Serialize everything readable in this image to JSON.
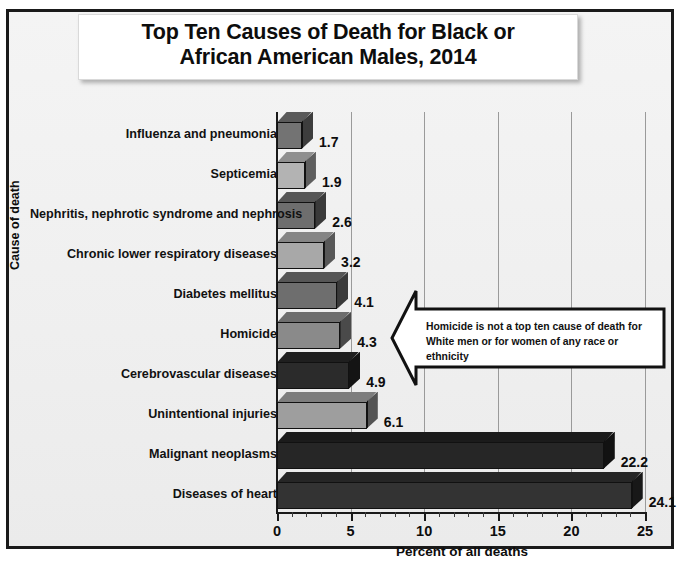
{
  "title": {
    "line1": "Top Ten Causes of Death for Black or",
    "line2": "African American Males, 2014"
  },
  "callout": {
    "text": "Homicide is not a top ten cause of death for White men or for women of any race or ethnicity",
    "shape": "left-arrow-callout"
  },
  "chart_data": {
    "type": "bar",
    "orientation": "horizontal",
    "title": "Top Ten Causes of Death for Black or African American Males, 2014",
    "xlabel": "Percent of all deaths",
    "ylabel": "Cause of death",
    "xlim": [
      0,
      25
    ],
    "xticks": [
      0,
      5,
      10,
      15,
      20,
      25
    ],
    "xtick_labels": [
      "0",
      "5",
      "10",
      "15",
      "20",
      "25"
    ],
    "minor_tick_step": 1,
    "grid": "vertical",
    "legend": "none",
    "categories": [
      "Influenza and pneumonia",
      "Septicemia",
      "Nephritis, nephrotic syndrome and nephrosis",
      "Chronic lower respiratory diseases",
      "Diabetes mellitus",
      "Homicide",
      "Cerebrovascular diseases",
      "Unintentional injuries",
      "Malignant neoplasms",
      "Diseases of heart"
    ],
    "values": [
      1.7,
      1.9,
      2.6,
      3.2,
      4.1,
      4.3,
      4.9,
      6.1,
      22.2,
      24.1
    ],
    "value_labels": [
      "1.7",
      "1.9",
      "2.6",
      "3.2",
      "4.1",
      "4.3",
      "4.9",
      "6.1",
      "22.2",
      "24.1"
    ],
    "bar_colors": [
      "#737373",
      "#b3b3b3",
      "#6e6e6e",
      "#a8a8a8",
      "#6e6e6e",
      "#8a8a8a",
      "#2b2b2b",
      "#9e9e9e",
      "#262626",
      "#333333"
    ],
    "bar_side_colors": [
      "#3d3d3d",
      "#5e5e5e",
      "#3a3a3a",
      "#585858",
      "#3a3a3a",
      "#4a4a4a",
      "#141414",
      "#545454",
      "#121212",
      "#181818"
    ],
    "bar_top_colors": [
      "#5a5a5a",
      "#8f8f8f",
      "#565656",
      "#858585",
      "#565656",
      "#6d6d6d",
      "#1f1f1f",
      "#7d7d7d",
      "#1b1b1b",
      "#262626"
    ]
  },
  "colors": {
    "frame": "#1a1a1a",
    "plot_background": "#f1f1f1",
    "gridline": "#9a9a9a",
    "text": "#0d0d0d"
  }
}
